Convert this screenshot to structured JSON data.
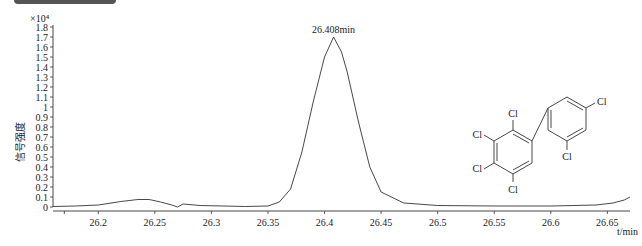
{
  "chart_data": {
    "type": "line",
    "title": "",
    "xlabel": "t/min",
    "ylabel": "信号强度",
    "y_multiplier": "×10⁴",
    "xlim": [
      26.16,
      26.67
    ],
    "ylim": [
      0,
      1.8
    ],
    "x_ticks": [
      26.2,
      26.25,
      26.3,
      26.35,
      26.4,
      26.45,
      26.5,
      26.55,
      26.6,
      26.65
    ],
    "x_tick_labels": [
      "26.2",
      "26.25",
      "26.3",
      "26.35",
      "26.4",
      "26.45",
      "26.5",
      "26.55",
      "26.6",
      "26.65"
    ],
    "y_ticks": [
      0,
      0.1,
      0.2,
      0.3,
      0.4,
      0.5,
      0.6,
      0.7,
      0.8,
      0.9,
      1,
      1.1,
      1.2,
      1.3,
      1.4,
      1.5,
      1.6,
      1.7,
      1.8
    ],
    "y_tick_labels": [
      "0",
      "0.1",
      "0.2",
      "0.3",
      "0.4",
      "0.5",
      "0.6",
      "0.7",
      "0.8",
      "0.9",
      "1",
      "1.1",
      "1.2",
      "1.3",
      "1.4",
      "1.5",
      "1.6",
      "1.7",
      "1.8"
    ],
    "grid": false,
    "series": [
      {
        "name": "chromatogram",
        "x": [
          26.16,
          26.18,
          26.2,
          26.22,
          26.235,
          26.245,
          26.255,
          26.265,
          26.27,
          26.275,
          26.29,
          26.31,
          26.33,
          26.35,
          26.36,
          26.37,
          26.38,
          26.39,
          26.4,
          26.408,
          26.415,
          26.42,
          26.43,
          26.44,
          26.45,
          26.47,
          26.5,
          26.55,
          26.6,
          26.64,
          26.655,
          26.665,
          26.67
        ],
        "y": [
          0.005,
          0.01,
          0.02,
          0.055,
          0.075,
          0.075,
          0.05,
          0.02,
          0.0,
          0.03,
          0.015,
          0.01,
          0.005,
          0.01,
          0.05,
          0.18,
          0.55,
          1.05,
          1.5,
          1.7,
          1.55,
          1.35,
          0.85,
          0.4,
          0.15,
          0.04,
          0.015,
          0.01,
          0.01,
          0.02,
          0.04,
          0.07,
          0.1
        ]
      }
    ],
    "annotations": [
      {
        "text": "26.408min",
        "x": 26.408,
        "y": 1.7
      }
    ]
  },
  "structure": {
    "atoms": [
      "Cl",
      "Cl",
      "Cl",
      "Cl",
      "Cl",
      "Cl"
    ],
    "description": "2,2',3,4,4',5-hexachlorobiphenyl"
  }
}
